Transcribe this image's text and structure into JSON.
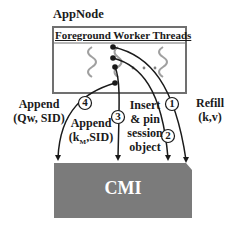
{
  "appnode": {
    "title": "AppNode",
    "header": "Foreground Worker Threads",
    "ellipsis": "• • •"
  },
  "cmi": {
    "label": "CMI",
    "fill_color": "#7b7b7b"
  },
  "steps": [
    {
      "number": "1",
      "label_line1": "Refill",
      "label_line2": "(k,v)"
    },
    {
      "number": "2",
      "label_line1": "Insert",
      "label_line2": "& pin",
      "label_line3": "session",
      "label_line4": "object"
    },
    {
      "number": "3",
      "label_line1": "Append",
      "label_line2": "(kM,SID)",
      "label_main": "(k",
      "label_sub": "M",
      "label_tail": ",SID)"
    },
    {
      "number": "4",
      "label_line1": "Append",
      "label_line2": "(Qw, SID)"
    }
  ],
  "colors": {
    "thread_wave": "#a0a0a0",
    "arrow": "#1a1a1a",
    "box_border": "#707070"
  }
}
